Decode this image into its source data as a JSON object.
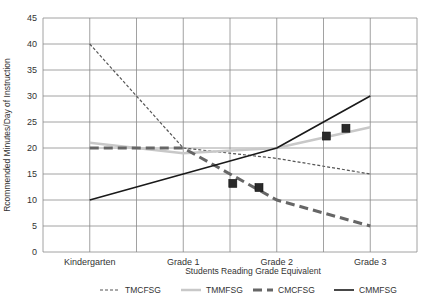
{
  "chart_data": {
    "type": "line",
    "title": "",
    "xlabel": "Students Reading Grade Equivalent",
    "ylabel": "Rcommended Minutes/Day of Instruction",
    "categories": [
      "Kindergarten",
      "Grade 1",
      "Grade 2",
      "Grade 3"
    ],
    "ylim": [
      0,
      45
    ],
    "yticks": [
      0,
      5,
      10,
      15,
      20,
      25,
      30,
      35,
      40,
      45
    ],
    "grid": true,
    "legend_position": "bottom",
    "series": [
      {
        "name": "TMCFSG",
        "values": [
          40,
          20,
          18,
          15
        ],
        "style": "short-dash",
        "color": "#555555",
        "width": 1.2
      },
      {
        "name": "TMMFSG",
        "values": [
          21,
          19,
          20,
          24
        ],
        "style": "solid",
        "color": "#c8c8c8",
        "width": 2.5
      },
      {
        "name": "CMCFSG",
        "values": [
          20,
          20,
          10,
          5
        ],
        "style": "long-dash",
        "color": "#666666",
        "width": 3
      },
      {
        "name": "CMMFSG",
        "values": [
          10,
          15,
          20,
          30
        ],
        "style": "solid",
        "color": "#1a1a1a",
        "width": 1.6
      }
    ],
    "markers": [
      {
        "x": 1.53,
        "y": 13.2
      },
      {
        "x": 1.81,
        "y": 12.4
      },
      {
        "x": 2.74,
        "y": 23.8
      },
      {
        "x": 2.53,
        "y": 22.3
      }
    ]
  }
}
